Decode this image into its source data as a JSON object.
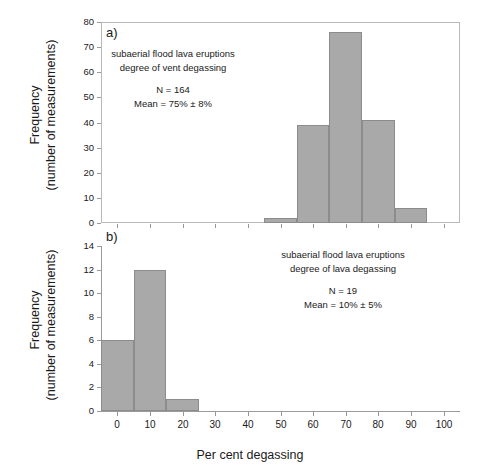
{
  "figure": {
    "axis_title_x": "Per cent degassing",
    "axis_title_y_line1": "Frequency",
    "axis_title_y_line2": "(number of measurements)",
    "bar_color": "#a9a9a9",
    "bar_edge_color": "#8c8c8c",
    "axis_color": "#9a9a9a",
    "text_color": "#1a1a1a"
  },
  "panel_a": {
    "tag": "a)",
    "annotation_line1": "subaerial flood lava eruptions",
    "annotation_line2": "degree of vent degassing",
    "annotation_line3": "N = 164",
    "annotation_line4": "Mean = 75% ± 8%",
    "y_ticks": [
      "0",
      "10",
      "20",
      "30",
      "40",
      "50",
      "60",
      "70",
      "80"
    ],
    "x_ticks": [
      "0",
      "10",
      "20",
      "30",
      "40",
      "50",
      "60",
      "70",
      "80",
      "90",
      "100"
    ]
  },
  "panel_b": {
    "tag": "b)",
    "annotation_line1": "subaerial flood lava eruptions",
    "annotation_line2": "degree of lava degassing",
    "annotation_line3": "N  = 19",
    "annotation_line4": "Mean = 10% ± 5%",
    "y_ticks": [
      "0",
      "2",
      "4",
      "6",
      "8",
      "10",
      "12",
      "14"
    ],
    "x_ticks": [
      "0",
      "10",
      "20",
      "30",
      "40",
      "50",
      "60",
      "70",
      "80",
      "90",
      "100"
    ]
  },
  "chart_data": [
    {
      "type": "bar",
      "id": "panel_a",
      "title": "a) subaerial flood lava eruptions - degree of vent degassing",
      "xlabel": "Per cent degassing",
      "ylabel": "Frequency (number of measurements)",
      "xlim": [
        -5,
        105
      ],
      "ylim": [
        0,
        80
      ],
      "ytick_step": 10,
      "xtick_step": 10,
      "grid": false,
      "legend": false,
      "bin_width": 10,
      "bin_centers": [
        50,
        60,
        70,
        80,
        90
      ],
      "bin_edges": [
        45,
        55,
        65,
        75,
        85,
        95
      ],
      "categories": [
        "45-55",
        "55-65",
        "65-75",
        "75-85",
        "85-95"
      ],
      "values": [
        2,
        39,
        76,
        41,
        6
      ],
      "n": 164,
      "mean_percent": 75,
      "uncertainty_percent": 8
    },
    {
      "type": "bar",
      "id": "panel_b",
      "title": "b) subaerial flood lava eruptions - degree of lava degassing",
      "xlabel": "Per cent degassing",
      "ylabel": "Frequency (number of measurements)",
      "xlim": [
        -5,
        105
      ],
      "ylim": [
        0,
        14
      ],
      "ytick_step": 2,
      "xtick_step": 10,
      "grid": false,
      "legend": false,
      "bin_width": 10,
      "bin_centers": [
        0,
        10,
        20
      ],
      "bin_edges": [
        -5,
        5,
        15,
        25
      ],
      "categories": [
        "-5-5",
        "5-15",
        "15-25"
      ],
      "values": [
        6,
        12,
        1
      ],
      "n": 19,
      "mean_percent": 10,
      "uncertainty_percent": 5
    }
  ]
}
